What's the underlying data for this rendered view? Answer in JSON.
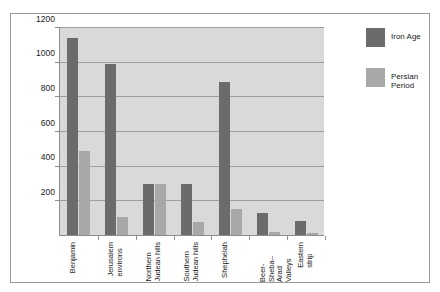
{
  "chart_data": {
    "type": "bar",
    "title": "",
    "xlabel": "",
    "ylabel": "",
    "ylim": [
      0,
      1200
    ],
    "yticks": [
      200,
      400,
      600,
      800,
      1000,
      1200
    ],
    "grid": true,
    "legend_position": "right",
    "categories": [
      "Benjamin",
      "Jerusalem\nenvirons",
      "Northern\nJudean hills",
      "Southern\nJudean hills",
      "Shephelah",
      "Beer-Sheba–\nArad Valleys",
      "Eastern\nstrip"
    ],
    "series": [
      {
        "name": "Iron Age",
        "color": "#6b6b6b",
        "values": [
          1140,
          995,
          300,
          300,
          890,
          130,
          85
        ]
      },
      {
        "name": "Persian Period",
        "color": "#a8a8a8",
        "values": [
          490,
          110,
          300,
          80,
          155,
          25,
          15
        ]
      }
    ]
  },
  "legend": {
    "items": [
      {
        "label": "Iron Age"
      },
      {
        "label": "Persian\nPeriod"
      }
    ]
  }
}
